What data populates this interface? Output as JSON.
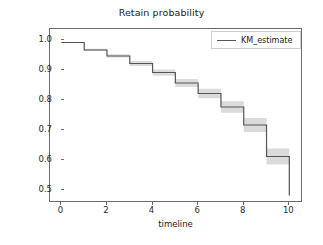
{
  "chart_data": {
    "type": "line",
    "title": "Retain probability",
    "xlabel": "timeline",
    "ylabel": "",
    "xlim": [
      -0.5,
      10.6
    ],
    "ylim": [
      0.455,
      1.035
    ],
    "xticks": [
      0,
      2,
      4,
      6,
      8,
      10
    ],
    "xtick_labels": [
      "0",
      "2",
      "4",
      "6",
      "8",
      "10"
    ],
    "yticks": [
      0.5,
      0.6,
      0.7,
      0.8,
      0.9,
      1.0
    ],
    "ytick_labels": [
      "0.5",
      "0.6",
      "0.7",
      "0.8",
      "0.9",
      "1.0"
    ],
    "grid": false,
    "drawstyle": "steps-post",
    "legend_position": "upper right",
    "series": [
      {
        "name": "KM_estimate",
        "color": "#555555",
        "x": [
          0,
          1,
          2,
          3,
          4,
          5,
          6,
          7,
          8,
          9,
          10
        ],
        "values": [
          0.99,
          0.965,
          0.945,
          0.92,
          0.89,
          0.855,
          0.82,
          0.775,
          0.715,
          0.61,
          0.48
        ],
        "ci_lower": [
          0.99,
          0.962,
          0.94,
          0.912,
          0.879,
          0.842,
          0.804,
          0.756,
          0.692,
          0.583,
          0.48
        ],
        "ci_upper": [
          0.99,
          0.969,
          0.951,
          0.928,
          0.9,
          0.868,
          0.836,
          0.794,
          0.738,
          0.637,
          0.48
        ],
        "ci_color": "#cfcfcf"
      }
    ]
  },
  "legend": {
    "entries": [
      {
        "label": "KM_estimate"
      }
    ]
  },
  "figure": {
    "background": "#ffffff",
    "axis_color": "#6b6b6b",
    "text_color": "#1a1a1a"
  }
}
